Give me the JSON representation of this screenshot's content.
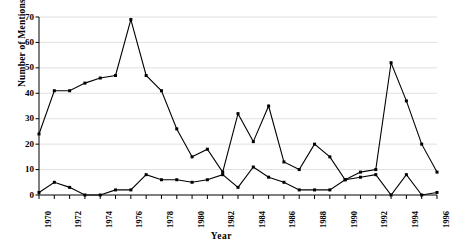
{
  "chart_data": {
    "type": "line",
    "title": "",
    "xlabel": "Year",
    "ylabel": "Number of Mentions",
    "xlim": [
      1970,
      1996
    ],
    "ylim": [
      0,
      70
    ],
    "ytick_values": [
      0,
      10,
      20,
      30,
      40,
      50,
      60,
      70
    ],
    "ytick_labels": [
      "0",
      "10",
      "20",
      "30",
      "40",
      "50",
      "60",
      "70"
    ],
    "xtick_values": [
      1970,
      1972,
      1974,
      1976,
      1978,
      1980,
      1982,
      1984,
      1986,
      1988,
      1990,
      1992,
      1994,
      1996
    ],
    "xtick_labels": [
      "1970",
      "1972",
      "1974",
      "1976",
      "1978",
      "1980",
      "1982",
      "1984",
      "1986",
      "1988",
      "1990",
      "1992",
      "1994",
      "1996"
    ],
    "x": [
      1970,
      1971,
      1972,
      1973,
      1974,
      1975,
      1976,
      1977,
      1978,
      1979,
      1980,
      1981,
      1982,
      1983,
      1984,
      1985,
      1986,
      1987,
      1988,
      1989,
      1990,
      1991,
      1992,
      1993,
      1994,
      1995,
      1996
    ],
    "grid": true,
    "grid_axis": "y",
    "legend": "none",
    "marker": "square",
    "line_color": "#000000",
    "grid_color": "#d8d8d8",
    "series": [
      {
        "name": "upper-series",
        "values": [
          24,
          41,
          41,
          44,
          46,
          47,
          69,
          47,
          41,
          26,
          15,
          18,
          9,
          32,
          21,
          35,
          13,
          10,
          20,
          15,
          6,
          9,
          10,
          52,
          37,
          20,
          9
        ]
      },
      {
        "name": "lower-series",
        "values": [
          1,
          5,
          3,
          0,
          0,
          2,
          2,
          8,
          6,
          6,
          5,
          6,
          8,
          3,
          11,
          7,
          5,
          2,
          2,
          2,
          6,
          7,
          8,
          0,
          8,
          0,
          1
        ]
      }
    ]
  }
}
